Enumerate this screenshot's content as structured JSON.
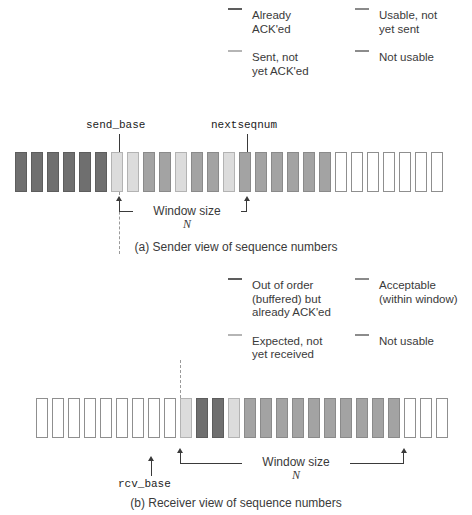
{
  "figure": {
    "colors": {
      "dark": "#6f6f6f",
      "mid": "#a3a3a3",
      "light": "#dcdcdc",
      "white": "#ffffff",
      "stroke": "#8f8f8f",
      "text": "#3a3a3a"
    }
  },
  "sender": {
    "legend": [
      {
        "id": "already-acked",
        "swatch": "dark",
        "label": "Already\nACK'ed"
      },
      {
        "id": "usable-not-sent",
        "swatch": "mid",
        "label": "Usable, not\nyet sent"
      },
      {
        "id": "sent-not-acked",
        "swatch": "light",
        "label": "Sent, not\nyet ACK'ed"
      },
      {
        "id": "not-usable",
        "swatch": "white",
        "label": "Not usable"
      }
    ],
    "pointers": [
      {
        "id": "send-base",
        "label": "send_base",
        "index": 6
      },
      {
        "id": "nextseqnum",
        "label": "nextseqnum",
        "index": 13
      }
    ],
    "window": {
      "label": "Window size",
      "n": "N",
      "start_index": 6,
      "end_index": 19
    },
    "caption": "(a) Sender view of sequence numbers",
    "cells": [
      "dark",
      "dark",
      "dark",
      "dark",
      "dark",
      "dark",
      "light",
      "light",
      "mid",
      "mid",
      "light",
      "mid",
      "mid",
      "light",
      "mid",
      "mid",
      "mid",
      "mid",
      "mid",
      "mid",
      "white",
      "white",
      "white",
      "white",
      "white",
      "white",
      "white"
    ]
  },
  "receiver": {
    "legend": [
      {
        "id": "out-of-order-buffered",
        "swatch": "dark",
        "label": "Out of order\n(buffered) but\nalready ACK'ed"
      },
      {
        "id": "acceptable",
        "swatch": "mid",
        "label": "Acceptable\n(within window)"
      },
      {
        "id": "expected-not-received",
        "swatch": "light",
        "label": "Expected, not\nyet received"
      },
      {
        "id": "not-usable",
        "swatch": "white",
        "label": "Not usable"
      }
    ],
    "pointers": [
      {
        "id": "rcv-base",
        "label": "rcv_base",
        "index": 9
      }
    ],
    "window": {
      "label": "Window size",
      "n": "N",
      "start_index": 9,
      "end_index": 22
    },
    "caption": "(b) Receiver view of sequence numbers",
    "cells": [
      "white",
      "white",
      "white",
      "white",
      "white",
      "white",
      "white",
      "white",
      "white",
      "light",
      "dark",
      "dark",
      "light",
      "mid",
      "mid",
      "mid",
      "mid",
      "mid",
      "mid",
      "mid",
      "mid",
      "mid",
      "mid",
      "white",
      "white",
      "white"
    ]
  }
}
